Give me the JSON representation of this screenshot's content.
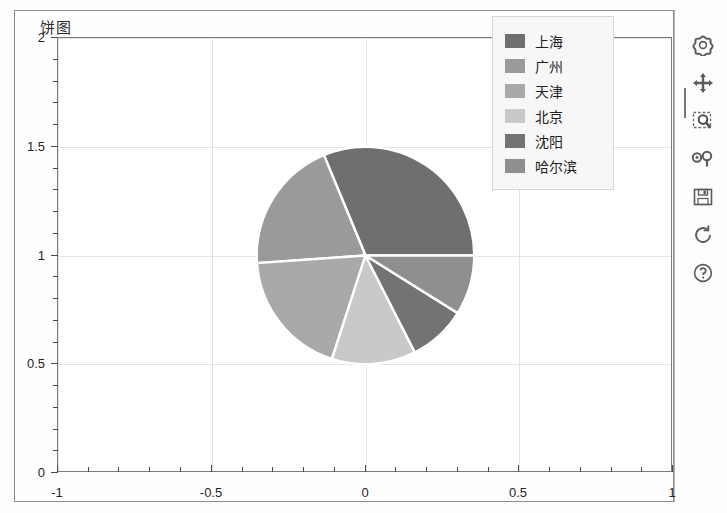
{
  "window": {
    "title": "饼图"
  },
  "chart_data": {
    "type": "pie",
    "title": "饼图",
    "xlabel": "",
    "ylabel": "",
    "xlim": [
      -1,
      1
    ],
    "ylim": [
      0,
      2
    ],
    "grid": true,
    "legend_position": "upper right",
    "center": [
      0,
      1
    ],
    "radius": 0.5,
    "start_angle": 0,
    "direction": "counterclockwise",
    "categories": [
      "上海",
      "广州",
      "天津",
      "北京",
      "沈阳",
      "哈尔滨"
    ],
    "values": [
      112.5,
      71.5,
      68,
      45,
      31,
      32
    ],
    "percentages": [
      31.3,
      19.9,
      18.9,
      12.5,
      8.6,
      8.8
    ],
    "colors": [
      "#6f6f6f",
      "#9a9a9a",
      "#a9a9a9",
      "#c9c9c9",
      "#737373",
      "#8f8f8f"
    ],
    "slices": [
      {
        "label": "上海",
        "start_deg": 0,
        "end_deg": 112.5,
        "sweep_deg": 112.5,
        "color": "#6f6f6f"
      },
      {
        "label": "广州",
        "start_deg": 112.5,
        "end_deg": 184,
        "sweep_deg": 71.5,
        "color": "#9a9a9a"
      },
      {
        "label": "天津",
        "start_deg": 184,
        "end_deg": 252,
        "sweep_deg": 68,
        "color": "#a9a9a9"
      },
      {
        "label": "北京",
        "start_deg": 252,
        "end_deg": 297,
        "sweep_deg": 45,
        "color": "#c9c9c9"
      },
      {
        "label": "沈阳",
        "start_deg": 297,
        "end_deg": 328,
        "sweep_deg": 31,
        "color": "#737373"
      },
      {
        "label": "哈尔滨",
        "start_deg": 328,
        "end_deg": 360,
        "sweep_deg": 32,
        "color": "#8f8f8f"
      }
    ],
    "x_ticks": [
      "-1",
      "-0.5",
      "0",
      "0.5",
      "1"
    ],
    "x_tick_values": [
      -1,
      -0.5,
      0,
      0.5,
      1
    ],
    "y_ticks": [
      "0",
      "0.5",
      "1",
      "1.5",
      "2"
    ],
    "y_tick_values": [
      0,
      0.5,
      1,
      1.5,
      2
    ],
    "minor_ticks_per_major": 5
  },
  "legend": {
    "entries": [
      {
        "label": "上海",
        "color": "#6f6f6f"
      },
      {
        "label": "广州",
        "color": "#9a9a9a"
      },
      {
        "label": "天津",
        "color": "#a9a9a9"
      },
      {
        "label": "北京",
        "color": "#c9c9c9"
      },
      {
        "label": "沈阳",
        "color": "#737373"
      },
      {
        "label": "哈尔滨",
        "color": "#8f8f8f"
      }
    ]
  },
  "toolbar": {
    "buttons": [
      {
        "name": "home-reset-button",
        "icon": "home-icon",
        "tooltip": "Reset original view"
      },
      {
        "name": "pan-button",
        "icon": "move-arrows-icon",
        "tooltip": "Pan axes"
      },
      {
        "name": "zoom-rect-button",
        "icon": "zoom-rect-icon",
        "tooltip": "Zoom to rectangle"
      },
      {
        "name": "subplots-button",
        "icon": "subplots-icon",
        "tooltip": "Configure subplots"
      },
      {
        "name": "save-button",
        "icon": "floppy-disk-icon",
        "tooltip": "Save the figure"
      },
      {
        "name": "refresh-button",
        "icon": "refresh-icon",
        "tooltip": "Refresh"
      },
      {
        "name": "help-button",
        "icon": "question-mark-icon",
        "tooltip": "Help"
      }
    ]
  },
  "colors": {
    "plot_background": "#ffffff",
    "figure_background": "#fefefe",
    "grid": "#e4e4e4",
    "axis": "#7b7b7b",
    "text": "#242424",
    "legend_background": "#f7f7f7"
  }
}
